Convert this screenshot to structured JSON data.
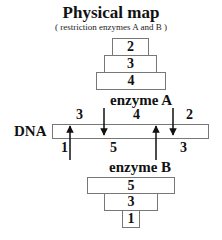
{
  "title": "Physical map",
  "subtitle": "( restriction enzymes A and B )",
  "enzyme_a": {
    "label": "enzyme A",
    "fragments": [
      "2",
      "3",
      "4"
    ]
  },
  "dna": {
    "label": "DNA",
    "top_labels": [
      "3",
      "4",
      "2"
    ],
    "bottom_labels": [
      "1",
      "5",
      "3"
    ]
  },
  "enzyme_b": {
    "label": "enzyme B",
    "fragments": [
      "5",
      "3",
      "1"
    ]
  },
  "colors": {
    "line": "#111111",
    "box_border": "#777777"
  }
}
